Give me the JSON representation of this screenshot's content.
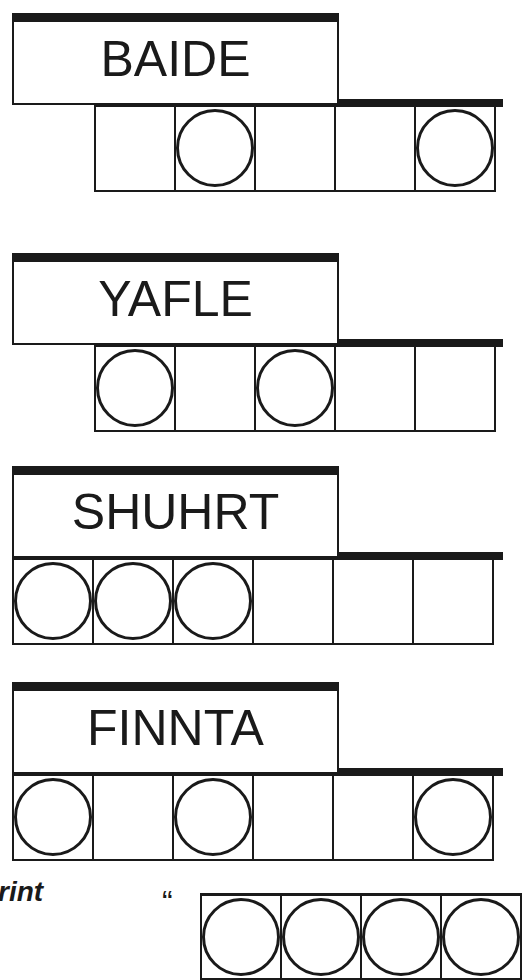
{
  "puzzles": [
    {
      "scrambled": "BAIDE",
      "cells_offset": 1,
      "num_cells": 5,
      "circled": [
        false,
        true,
        false,
        false,
        true
      ]
    },
    {
      "scrambled": "YAFLE",
      "cells_offset": 1,
      "num_cells": 5,
      "circled": [
        true,
        false,
        true,
        false,
        false
      ]
    },
    {
      "scrambled": "SHUHRT",
      "cells_offset": 0,
      "num_cells": 6,
      "circled": [
        true,
        true,
        true,
        false,
        false,
        false
      ]
    },
    {
      "scrambled": "FINNTA",
      "cells_offset": 0,
      "num_cells": 6,
      "circled": [
        true,
        false,
        true,
        false,
        false,
        true
      ]
    }
  ],
  "footer": {
    "print_label": "rint",
    "open_quote": "“",
    "answer_cells": [
      true,
      true,
      true,
      true
    ]
  },
  "colors": {
    "ink": "#1a1a1a",
    "paper": "#ffffff"
  }
}
